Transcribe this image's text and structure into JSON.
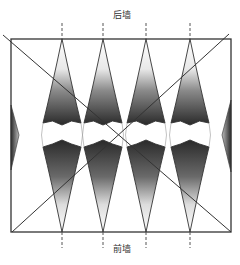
{
  "diagram": {
    "labels": {
      "back_wall": "后墙",
      "front_wall": "前墙"
    },
    "room": {
      "x": 11,
      "y": 39,
      "width": 220,
      "height": 193
    },
    "diagonals": [
      {
        "x1": 3,
        "y1": 35,
        "x2": 231,
        "y2": 232
      },
      {
        "x1": 12,
        "y1": 232,
        "x2": 229,
        "y2": 34
      }
    ],
    "lenses": [
      {
        "cx": 62
      },
      {
        "cx": 103
      },
      {
        "cx": 146
      },
      {
        "cx": 190
      }
    ],
    "lens_half_width": 19,
    "side_wedges": [
      {
        "side": "left",
        "x": 11
      },
      {
        "side": "right",
        "x": 231
      }
    ],
    "colors": {
      "line": "#333333",
      "dark": "#2a2a2a",
      "light": "#ffffff"
    }
  }
}
